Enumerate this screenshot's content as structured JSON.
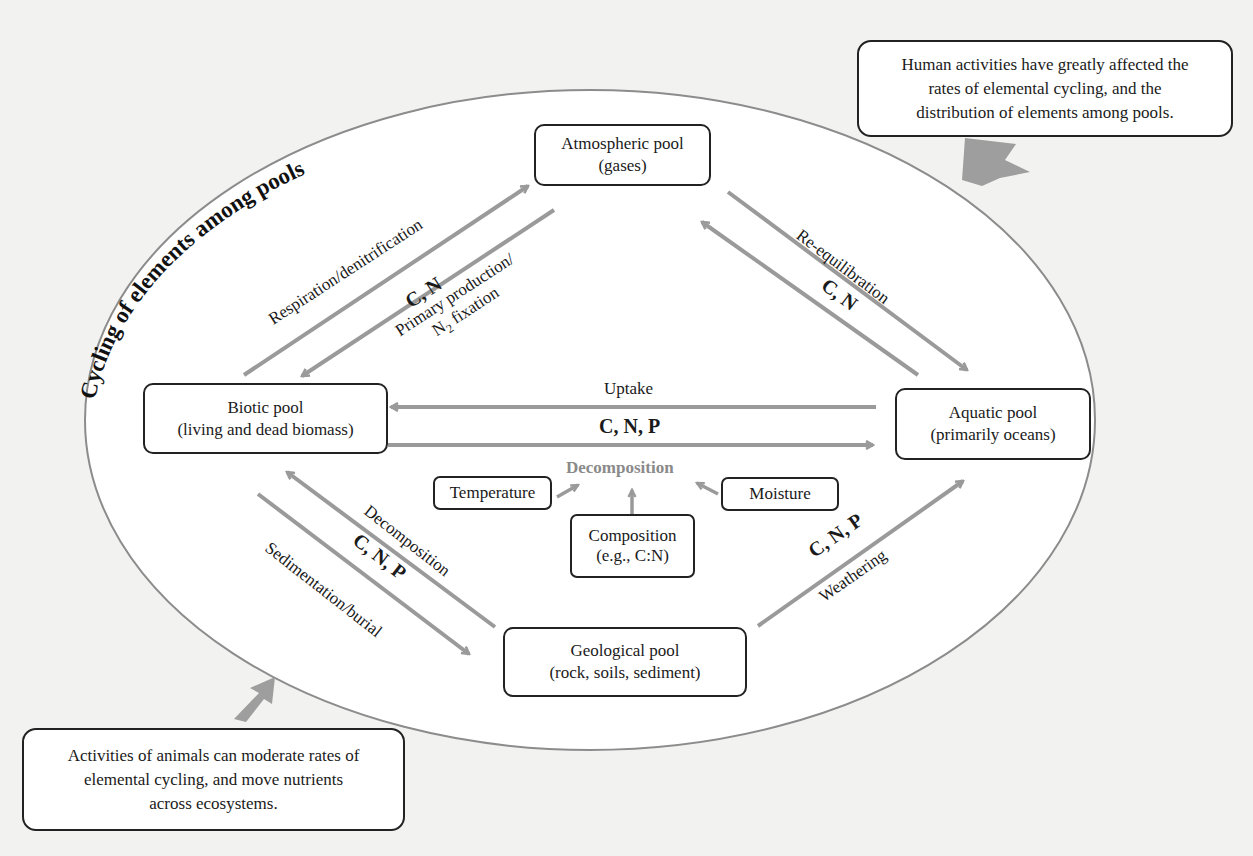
{
  "title": "Cycling of elements among pools",
  "colors": {
    "background": "#f2f2f0",
    "ellipse_fill": "#ffffff",
    "ellipse_stroke": "#8c8c8c",
    "arrow": "#9a9a9a",
    "box_border": "#222222",
    "decomposition_label": "#8a8a8a"
  },
  "pools": {
    "atmospheric": {
      "name": "Atmospheric pool",
      "detail": "(gases)"
    },
    "biotic": {
      "name": "Biotic pool",
      "detail": "(living and dead biomass)"
    },
    "aquatic": {
      "name": "Aquatic pool",
      "detail": "(primarily oceans)"
    },
    "geological": {
      "name": "Geological pool",
      "detail": "(rock, soils, sediment)"
    }
  },
  "fluxes": {
    "respiration": "Respiration/denitrification",
    "biotic_atmos_elements": "C, N",
    "primary_production_line1": "Primary production/",
    "primary_production_line2_pre": "N",
    "primary_production_line2_sub": "2",
    "primary_production_line2_post": " fixation",
    "reequilibration": "Re-equilibration",
    "atmos_aquatic_elements": "C, N",
    "uptake": "Uptake",
    "biotic_aquatic_elements": "C, N, P",
    "decomposition_biotic_geo": "Decomposition",
    "biotic_geo_elements": "C, N, P",
    "sedimentation": "Sedimentation/burial",
    "weathering": "Weathering",
    "geo_aquatic_elements": "C, N, P"
  },
  "decomposition_factors": {
    "label": "Decomposition",
    "temperature": "Temperature",
    "moisture": "Moisture",
    "composition_line1": "Composition",
    "composition_line2": "(e.g., C:N)"
  },
  "callouts": {
    "human": {
      "line1": "Human activities have greatly affected the",
      "line2": "rates of elemental cycling, and the",
      "line3": "distribution of elements among pools."
    },
    "animals": {
      "line1": "Activities of animals can moderate rates of",
      "line2": "elemental cycling, and move nutrients",
      "line3": "across ecosystems."
    }
  },
  "icons": {
    "human_callout_arrow": "block-arrow-down-left",
    "animals_callout_arrow": "block-arrow-up-right"
  }
}
